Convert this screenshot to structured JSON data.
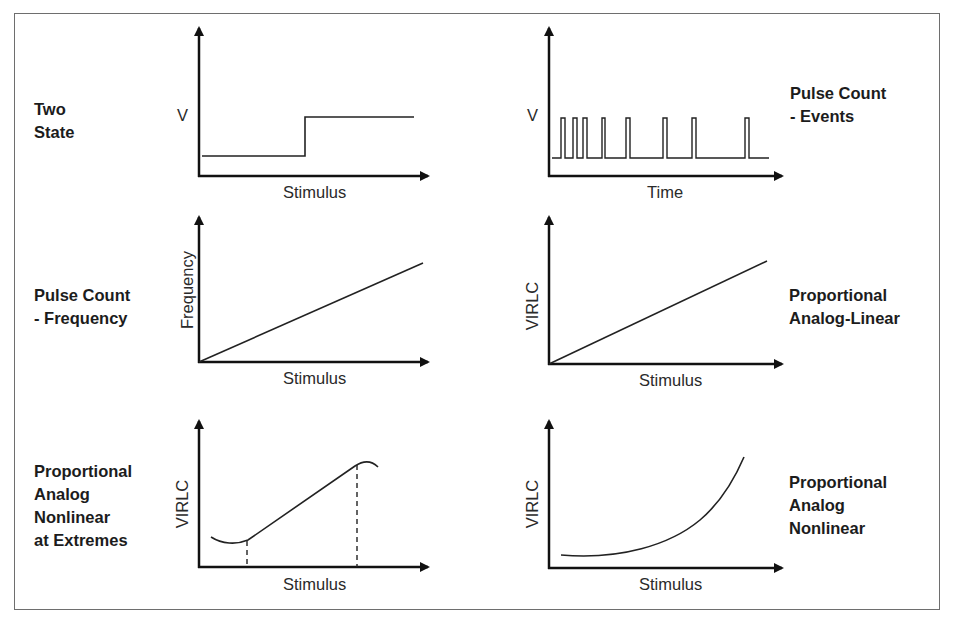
{
  "figure": {
    "panels": [
      {
        "id": "two-state",
        "title_lines": [
          "Two",
          "State"
        ],
        "ylabel": "V",
        "xlabel": "Stimulus",
        "curve": "step"
      },
      {
        "id": "pulse-count-events",
        "title_lines": [
          "Pulse Count",
          "- Events"
        ],
        "ylabel": "V",
        "xlabel": "Time",
        "curve": "pulse-train"
      },
      {
        "id": "pulse-count-frequency",
        "title_lines": [
          "Pulse Count",
          "- Frequency"
        ],
        "ylabel": "Frequency",
        "xlabel": "Stimulus",
        "curve": "linear"
      },
      {
        "id": "proportional-analog-linear",
        "title_lines": [
          "Proportional",
          "Analog-Linear"
        ],
        "ylabel": "VIRLC",
        "xlabel": "Stimulus",
        "curve": "linear"
      },
      {
        "id": "proportional-analog-nonlinear-extremes",
        "title_lines": [
          "Proportional",
          "Analog",
          "Nonlinear",
          "at Extremes"
        ],
        "ylabel": "VIRLC",
        "xlabel": "Stimulus",
        "curve": "linear-with-nonlinear-ends"
      },
      {
        "id": "proportional-analog-nonlinear",
        "title_lines": [
          "Proportional",
          "Analog",
          "Nonlinear"
        ],
        "ylabel": "VIRLC",
        "xlabel": "Stimulus",
        "curve": "exponential"
      }
    ],
    "colors": {
      "stroke": "#1a1a1a",
      "frame": "#6e6e6e",
      "background": "#ffffff"
    }
  }
}
